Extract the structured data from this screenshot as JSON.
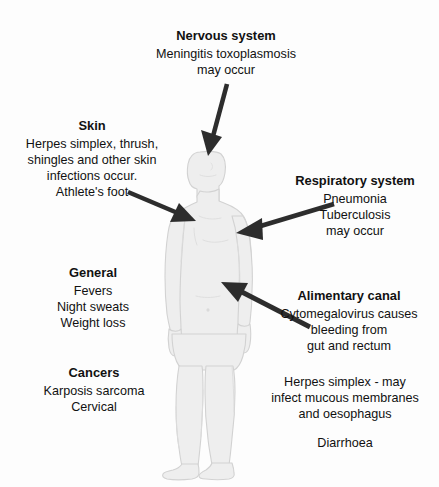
{
  "diagram": {
    "background_color": "#fdfdfd",
    "arrow_color": "#2d2d2d",
    "body_fill_color": "#eeeeee",
    "body_outline_color": "#d2d2d2",
    "figure_label": "human-body-silhouette"
  },
  "callouts": {
    "nervous": {
      "title": "Nervous system",
      "lines": [
        "Meningitis toxoplasmosis",
        "may occur"
      ]
    },
    "skin": {
      "title": "Skin",
      "lines": [
        "Herpes simplex, thrush,",
        "shingles and other skin",
        "infections occur.",
        "Athlete's foot"
      ]
    },
    "respiratory": {
      "title": "Respiratory system",
      "lines": [
        "Pneumonia",
        "Tuberculosis",
        "may occur"
      ]
    },
    "general": {
      "title": "General",
      "lines": [
        "Fevers",
        "Night sweats",
        "Weight loss"
      ]
    },
    "alimentary": {
      "title": "Alimentary canal",
      "lines": [
        "Cytomegalovirus causes",
        "bleeding from",
        "gut and rectum"
      ]
    },
    "cancers": {
      "title": "Cancers",
      "lines": [
        "Karposis sarcoma",
        "Cervical"
      ]
    },
    "extra": {
      "lines": [
        "Herpes simplex - may",
        "infect mucous membranes",
        "and oesophagus"
      ],
      "lines2": [
        "Diarrhoea"
      ]
    }
  },
  "arrows": [
    {
      "name": "arrow-to-head",
      "from": "nervous",
      "target": "head"
    },
    {
      "name": "arrow-to-chest-left",
      "from": "skin",
      "target": "upper-chest"
    },
    {
      "name": "arrow-to-chest-right",
      "from": "respiratory",
      "target": "chest"
    },
    {
      "name": "arrow-to-abdomen",
      "from": "alimentary",
      "target": "abdomen"
    }
  ]
}
